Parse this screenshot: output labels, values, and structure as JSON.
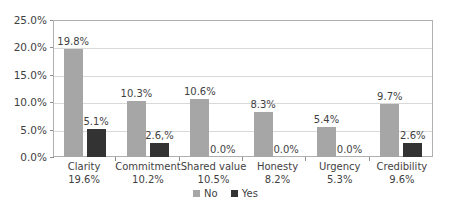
{
  "chart_data": {
    "type": "bar",
    "title": "",
    "subtitle": "",
    "xlabel": "",
    "ylabel": "",
    "ylim": [
      0,
      25
    ],
    "ytick_labels": [
      "25.0%",
      "20.0%",
      "15.0%",
      "10.0%",
      "5.0%",
      "0.0%"
    ],
    "ytick_values": [
      25,
      20,
      15,
      10,
      5,
      0
    ],
    "grid": true,
    "legend_position": "bottom-center",
    "categories": [
      "Clarity",
      "Commitment",
      "Shared value",
      "Honesty",
      "Urgency",
      "Credibility"
    ],
    "category_sublabels": [
      "19.6%",
      "10.2%",
      "10.5%",
      "8.2%",
      "5.3%",
      "9.6%"
    ],
    "series": [
      {
        "name": "No",
        "color": "#a6a6a6",
        "values": [
          19.8,
          10.3,
          10.6,
          8.3,
          5.4,
          9.7
        ],
        "labels": [
          "19.8%",
          "10.3%",
          "10.6%",
          "8.3%",
          "5.4%",
          "9.7%"
        ]
      },
      {
        "name": "Yes",
        "color": "#333333",
        "values": [
          5.1,
          2.6,
          0.0,
          0.0,
          0.0,
          2.6
        ],
        "labels": [
          "5.1%",
          "2.6,%",
          "0.0%",
          "0.0%",
          "0.0%",
          "2.6%"
        ]
      }
    ]
  },
  "legend": {
    "items": [
      {
        "label": "No",
        "color": "#a6a6a6"
      },
      {
        "label": "Yes",
        "color": "#333333"
      }
    ]
  }
}
